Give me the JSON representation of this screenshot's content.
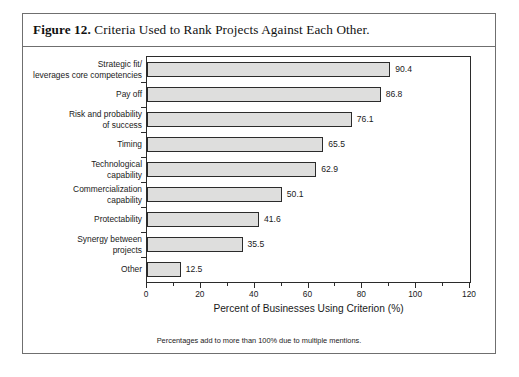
{
  "figure": {
    "number": "Figure 12.",
    "caption": "Criteria Used to Rank Projects Against Each Other.",
    "footnote": "Percentages add to more than 100% due to multiple mentions."
  },
  "colors": {
    "bar_fill": "#dededd",
    "bar_stroke": "#2b2b2b",
    "frame": "#6f6f6f",
    "text": "#1a1a1a",
    "background": "#ffffff"
  },
  "chart_data": {
    "type": "bar",
    "orientation": "horizontal",
    "title": "Criteria Used to Rank Projects Against Each Other.",
    "xlabel": "Percent of Businesses Using Criterion (%)",
    "ylabel": "",
    "xlim": [
      0,
      120
    ],
    "xticks": [
      0,
      20,
      40,
      60,
      80,
      100,
      120
    ],
    "xtick_labels": [
      "0",
      "20",
      "40",
      "60",
      "80",
      "100",
      "120"
    ],
    "minor_xticks": [
      10,
      30,
      50,
      70,
      90,
      110
    ],
    "grid": false,
    "legend": null,
    "categories": [
      "Strategic fit/\nleverages core competencies",
      "Pay off",
      "Risk and probability\nof success",
      "Timing",
      "Technological\ncapability",
      "Commercialization\ncapability",
      "Protectability",
      "Synergy between\nprojects",
      "Other"
    ],
    "values": [
      90.4,
      86.8,
      76.1,
      65.5,
      62.9,
      50.1,
      41.6,
      35.5,
      12.5
    ],
    "value_labels": [
      "90.4",
      "86.8",
      "76.1",
      "65.5",
      "62.9",
      "50.1",
      "41.6",
      "35.5",
      "12.5"
    ]
  }
}
